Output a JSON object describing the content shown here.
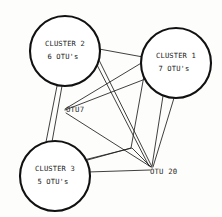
{
  "diagram": {
    "background_color": "#fdfdfc",
    "ink_color": "#1a1a1a",
    "clusters": [
      {
        "id": "cluster1",
        "name": "cluster-1",
        "line1": "CLUSTER 1",
        "line2": "7 OTU's",
        "cx": 176,
        "cy": 63,
        "r": 35
      },
      {
        "id": "cluster2",
        "name": "cluster-2",
        "line1": "CLUSTER 2",
        "line2": "6 OTU's",
        "cx": 65,
        "cy": 51,
        "r": 35
      },
      {
        "id": "cluster3",
        "name": "cluster-3",
        "line1": "CLUSTER 3",
        "line2": "5 OTU's",
        "cx": 55,
        "cy": 176,
        "r": 35
      }
    ],
    "otu_nodes": [
      {
        "id": "otu7",
        "name": "otu-7",
        "label": "OTU7",
        "x": 64,
        "y": 110,
        "label_x": 66,
        "label_y": 110
      },
      {
        "id": "otu20",
        "name": "otu-20",
        "label": "OTU 20",
        "x": 152,
        "y": 168,
        "label_x": 150,
        "label_y": 172
      }
    ],
    "edges": [
      {
        "id": "e1",
        "from": "cluster2",
        "to": "cluster1",
        "points": "99,49 143,57"
      },
      {
        "id": "e2",
        "from": "cluster2",
        "to": "otu20",
        "points": "98,58 152,167"
      },
      {
        "id": "e3",
        "from": "cluster2",
        "to": "otu20",
        "points": "96,63 149,166"
      },
      {
        "id": "e4",
        "from": "cluster2",
        "to": "cluster3",
        "points": "57,86 46,142"
      },
      {
        "id": "e5",
        "from": "cluster2",
        "to": "cluster3",
        "points": "62,86 52,142"
      },
      {
        "id": "e6",
        "from": "cluster1",
        "to": "otu7",
        "points": "143,62 65,109"
      },
      {
        "id": "e7",
        "from": "cluster1",
        "to": "otu7",
        "points": "148,78 65,110"
      },
      {
        "id": "e8",
        "from": "cluster1",
        "to": "otu20",
        "points": "163,96 152,166"
      },
      {
        "id": "e9",
        "from": "cluster1",
        "to": "otu20",
        "points": "174,98 153,167"
      },
      {
        "id": "e10",
        "from": "otu7",
        "to": "otu20",
        "points": "66,113 151,167"
      },
      {
        "id": "e11",
        "from": "cluster3",
        "to": "otu20",
        "points": "88,172 150,170"
      },
      {
        "id": "e12",
        "from": "cluster3",
        "to": "otu20",
        "points": "84,160 132,148 151,167"
      },
      {
        "id": "e13",
        "from": "cluster1",
        "to": "cluster3",
        "points": "145,70 131,148 84,161"
      }
    ]
  }
}
